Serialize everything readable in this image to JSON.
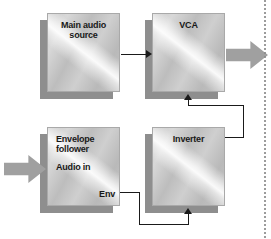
{
  "diagram": {
    "type": "signal-flow-block-diagram",
    "background_color": "#ffffff",
    "line_color": "#1a1a1a",
    "block_fill": "#c6c6c6",
    "shadow_color": "#8e8e8e",
    "arrow_fill": "#a0a0a0",
    "blocks": [
      {
        "id": "main-audio-source",
        "title": "Main audio\nsource",
        "title_align": "center"
      },
      {
        "id": "vca",
        "title": "VCA",
        "title_align": "center"
      },
      {
        "id": "envelope-follower",
        "title": "Envelope\nfollower",
        "title_align": "left",
        "ports": [
          {
            "id": "audio-in",
            "label": "Audio in",
            "side": "left"
          },
          {
            "id": "env-out",
            "label": "Env",
            "side": "right"
          }
        ]
      },
      {
        "id": "inverter",
        "title": "Inverter",
        "title_align": "center"
      }
    ],
    "block_arrows": [
      {
        "id": "audio-input",
        "direction": "right"
      },
      {
        "id": "vca-output",
        "direction": "right"
      }
    ],
    "connections": [
      {
        "id": "main-to-vca",
        "from": "main-audio-source",
        "to": "vca"
      },
      {
        "id": "inverter-to-vca",
        "from": "inverter",
        "to": "vca"
      },
      {
        "id": "env-to-inverter",
        "from": "envelope-follower.env-out",
        "to": "inverter"
      }
    ]
  }
}
